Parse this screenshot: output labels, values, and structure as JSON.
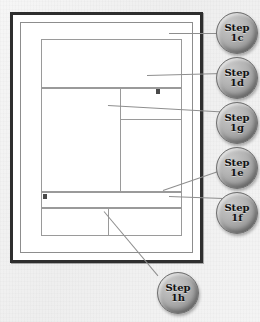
{
  "figure": {
    "background_color": "#f1f1f1",
    "paper_color": "#ffffff",
    "frame_color": "#2e2e2e",
    "rule_color": "#9a9a9a",
    "callout_fill": "#b4b4b4",
    "callout_text_color": "#121212",
    "leader_color": "#8e8e8e"
  },
  "document": {
    "name": "page-frame",
    "regions": [
      {
        "name": "header-region",
        "label": ""
      },
      {
        "name": "content-region",
        "label": ""
      },
      {
        "name": "content-column",
        "label": ""
      },
      {
        "name": "toolbar-strip",
        "label": ""
      },
      {
        "name": "footer-region",
        "label": ""
      },
      {
        "name": "footer-column",
        "label": ""
      }
    ]
  },
  "callouts": [
    {
      "id": "1c",
      "line1": "Step",
      "line2": "1c",
      "text": "Step 1c",
      "target": "header-region-top-rule"
    },
    {
      "id": "1d",
      "line1": "Step",
      "line2": "1d",
      "text": "Step 1d",
      "target": "header-content-divider"
    },
    {
      "id": "1g",
      "line1": "Step",
      "line2": "1g",
      "text": "Step 1g",
      "target": "content-column-subrule"
    },
    {
      "id": "1e",
      "line1": "Step",
      "line2": "1e",
      "text": "Step 1e",
      "target": "content-region-bottom"
    },
    {
      "id": "1f",
      "line1": "Step",
      "line2": "1f",
      "text": "Step 1f",
      "target": "footer-region-top"
    },
    {
      "id": "1h",
      "line1": "Step",
      "line2": "1h",
      "text": "Step 1h",
      "target": "footer-column-divider"
    }
  ]
}
